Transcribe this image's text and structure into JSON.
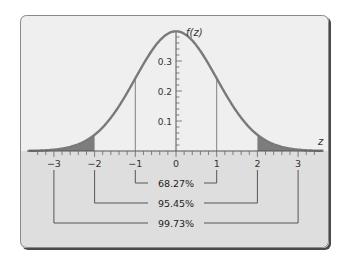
{
  "chart_data": {
    "type": "area",
    "title": "",
    "subtitle": "Standard normal distribution",
    "xlabel": "z",
    "ylabel": "f(z)",
    "xlim": [
      -3.5,
      3.5
    ],
    "ylim": [
      0,
      0.4
    ],
    "grid": false,
    "x_ticks": [
      -3,
      -2,
      -1,
      0,
      1,
      2,
      3
    ],
    "x_tick_labels": [
      "−3",
      "−2",
      "−1",
      "0",
      "1",
      "2",
      "3"
    ],
    "x_minor_tick_step": 0.2,
    "y_ticks": [
      0.1,
      0.2,
      0.3
    ],
    "y_tick_labels": [
      "0.1",
      "0.2",
      "0.3"
    ],
    "y_minor_tick_step": 0.02,
    "curve": {
      "name": "f(z)",
      "function": "standard normal pdf",
      "mean": 0,
      "sd": 1,
      "peak": 0.3989
    },
    "vertical_markers": [
      -1,
      1
    ],
    "shaded_regions": [
      {
        "from": -3.5,
        "to": -2,
        "label": "lower tail"
      },
      {
        "from": 2,
        "to": 3.5,
        "label": "upper tail"
      }
    ],
    "intervals": [
      {
        "from": -1,
        "to": 1,
        "label": "68.27%",
        "value": 68.27
      },
      {
        "from": -2,
        "to": 2,
        "label": "95.45%",
        "value": 95.45
      },
      {
        "from": -3,
        "to": 3,
        "label": "99.73%",
        "value": 99.73
      }
    ],
    "colors": {
      "curve": "#7a7a7a",
      "tail_fill": "#7d7d7d",
      "plot_bg": "#efefef",
      "lower_band_bg": "#dcdcdc",
      "frame": "#555555",
      "text": "#333333"
    }
  }
}
